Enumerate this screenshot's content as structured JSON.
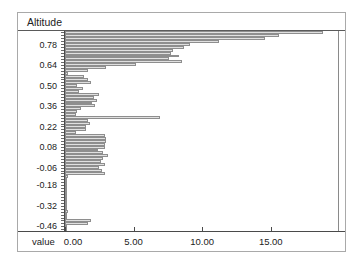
{
  "header": {
    "title": "Altitude"
  },
  "axes": {
    "x_title": "value"
  },
  "colors": {
    "bar_fill": "#e0e0e0",
    "bar_border": "#8e8e8e",
    "axis": "#4a4a4a",
    "frame_border": "#a9a9a9",
    "background": "#ffffff"
  },
  "chart_data": {
    "type": "bar",
    "orientation": "horizontal",
    "title": "Altitude",
    "xlabel": "value",
    "ylabel": "Altitude",
    "xlim": [
      0,
      19.9
    ],
    "grid": false,
    "legend": "none",
    "x_ticks": [
      0,
      5,
      10,
      15
    ],
    "x_tick_labels": [
      "0.00",
      "5.00",
      "10.00",
      "15.00"
    ],
    "y_tick_labels": [
      "0.78",
      "0.64",
      "0.50",
      "0.36",
      "0.22",
      "0.08",
      "-0.06",
      "-0.18",
      "-0.32",
      "-0.46"
    ],
    "altitudes": [
      0.86,
      0.84,
      0.82,
      0.8,
      0.78,
      0.76,
      0.74,
      0.72,
      0.7,
      0.68,
      0.66,
      0.64,
      0.62,
      0.6,
      0.58,
      0.56,
      0.54,
      0.52,
      0.5,
      0.48,
      0.46,
      0.44,
      0.42,
      0.4,
      0.38,
      0.36,
      0.34,
      0.32,
      0.3,
      0.28,
      0.26,
      0.24,
      0.22,
      0.2,
      0.18,
      0.16,
      0.14,
      0.12,
      0.1,
      0.08,
      0.06,
      0.04,
      0.02,
      0.0,
      -0.02,
      -0.04,
      -0.06,
      -0.08,
      -0.1,
      -0.12,
      -0.14,
      -0.16,
      -0.18,
      -0.2,
      -0.22,
      -0.24,
      -0.26,
      -0.28,
      -0.3,
      -0.32,
      -0.34,
      -0.36,
      -0.38,
      -0.4,
      -0.42,
      -0.44,
      -0.46,
      -0.48
    ],
    "values": [
      18.8,
      15.6,
      14.6,
      11.2,
      9.1,
      8.7,
      7.9,
      7.7,
      8.3,
      7.6,
      8.5,
      5.2,
      3.0,
      1.7,
      0.2,
      1.4,
      1.7,
      1.9,
      0.9,
      1.3,
      1.0,
      2.5,
      2.1,
      2.3,
      2.0,
      2.2,
      1.2,
      0.9,
      0.8,
      6.9,
      1.7,
      1.8,
      1.5,
      1.5,
      0.8,
      2.9,
      3.0,
      3.0,
      2.9,
      2.9,
      2.4,
      2.8,
      3.1,
      2.8,
      2.6,
      2.9,
      2.5,
      2.7,
      2.9,
      0.2,
      0.1,
      0.1,
      0.1,
      0.1,
      0.1,
      0.1,
      0.1,
      0.1,
      0.1,
      0.1,
      0.1,
      0.2,
      0.1,
      0.1,
      1.9,
      1.7,
      0.1,
      0.1
    ]
  }
}
